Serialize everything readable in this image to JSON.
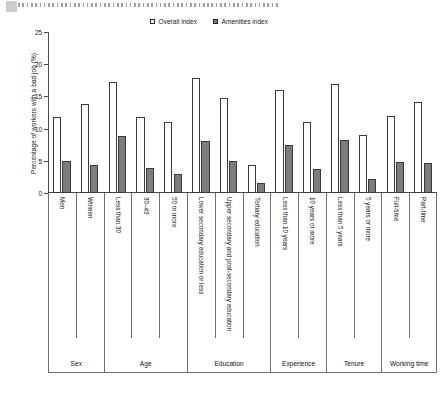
{
  "top_strip": {
    "tab_block_icon": "page-tab-marker",
    "dots_icon": "dotted-ruler"
  },
  "legend": {
    "position": "top-center",
    "entries": [
      {
        "label": "Overall index",
        "swatch": "open-square",
        "color": "#ffffff"
      },
      {
        "label": "Amenities index",
        "swatch": "filled-square",
        "color": "#7d7d7d"
      }
    ]
  },
  "chart_data": {
    "type": "bar",
    "title": "",
    "xlabel": "",
    "ylabel": "Percentage of workers with a bad job (%)",
    "ylim": [
      0,
      25
    ],
    "yticks": [
      0,
      5,
      10,
      15,
      20,
      25
    ],
    "grid": false,
    "legend_position": "top-center",
    "categories": [
      "Men",
      "Women",
      "Less than 30",
      "30–49",
      "50 or more",
      "Lower secondary education or less",
      "Upper secondary and post-secondary education",
      "Tertiary education",
      "Less than 10 years",
      "10 years or more",
      "Less than 5 years",
      "5 years or more",
      "Full-time",
      "Part-time"
    ],
    "groups": [
      {
        "label": "Sex",
        "span": 2
      },
      {
        "label": "Age",
        "span": 3
      },
      {
        "label": "Education",
        "span": 3
      },
      {
        "label": "Experience",
        "span": 2
      },
      {
        "label": "Tenure",
        "span": 2
      },
      {
        "label": "Working time",
        "span": 2
      }
    ],
    "series": [
      {
        "name": "Overall index",
        "values": [
          11.8,
          13.8,
          17.2,
          11.8,
          11.1,
          17.9,
          14.7,
          4.4,
          16.0,
          11.1,
          17.0,
          9.0,
          12.0,
          14.2
        ]
      },
      {
        "name": "Amenities index",
        "values": [
          5.0,
          4.4,
          8.9,
          3.9,
          2.9,
          8.1,
          5.0,
          1.5,
          7.5,
          3.7,
          8.2,
          2.2,
          4.8,
          4.7
        ]
      }
    ]
  }
}
